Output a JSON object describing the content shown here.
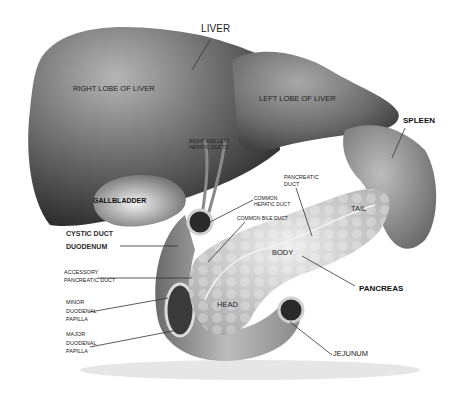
{
  "diagram": {
    "labels": {
      "liver": "LIVER",
      "right_lobe": "RIGHT LOBE OF LIVER",
      "left_lobe": "LEFT LOBE OF LIVER",
      "spleen": "SPLEEN",
      "hepatic_ducts_line1": "RIGHT AND LEFT",
      "hepatic_ducts_line2": "HEPATIC DUCTS",
      "gallbladder": "GALLBLADDER",
      "cystic_duct": "CYSTIC DUCT",
      "duodenum": "DUODENUM",
      "common_hepatic_duct_line1": "COMMON",
      "common_hepatic_duct_line2": "HEPATIC DUCT",
      "common_bile_duct": "COMMON BILE DUCT",
      "pancreatic_duct_line1": "PANCREATIC",
      "pancreatic_duct_line2": "DUCT",
      "tail": "TAIL",
      "body": "BODY",
      "pancreas": "PANCREAS",
      "accessory_line1": "ACCESSORY",
      "accessory_line2": "PANCREATIC DUCT",
      "minor_line1": "MINOR",
      "minor_line2": "DUODENAL",
      "minor_line3": "PAPILLA",
      "major_line1": "MAJOR",
      "major_line2": "DUODENAL",
      "major_line3": "PAPILLA",
      "head": "HEAD",
      "jejunum": "JEJUNUM"
    },
    "colors": {
      "background": "#ffffff",
      "organ_dark": "#2e2e2e",
      "organ_mid": "#6b6b6b",
      "organ_light": "#c9c9c9",
      "pancreas": "#d8d8d8",
      "leader_line": "#333333"
    }
  }
}
